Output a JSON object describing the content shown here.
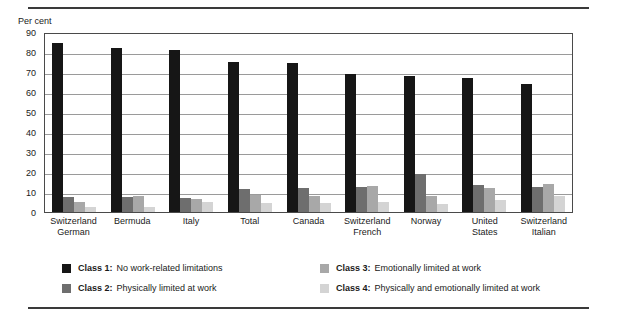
{
  "axis": {
    "y_title": "Per cent",
    "y_ticks": [
      "90",
      "80",
      "70",
      "60",
      "50",
      "40",
      "30",
      "20",
      "10",
      "0"
    ]
  },
  "legend": {
    "items": [
      {
        "key": "Class 1:",
        "desc": "No work-related limitations",
        "color": "#161616",
        "swatch": "class-1-swatch"
      },
      {
        "key": "Class 3:",
        "desc": "Emotionally limited at work",
        "color": "#a8a8a8",
        "swatch": "class-3-swatch"
      },
      {
        "key": "Class 2:",
        "desc": "Physically limited at work",
        "color": "#6e6e6e",
        "swatch": "class-2-swatch"
      },
      {
        "key": "Class 4:",
        "desc": "Physically and emotionally limited at work",
        "color": "#d4d4d4",
        "swatch": "class-4-swatch"
      }
    ]
  },
  "xlabels": [
    {
      "line1": "Switzerland",
      "line2": "German"
    },
    {
      "line1": "Bermuda",
      "line2": ""
    },
    {
      "line1": "Italy",
      "line2": ""
    },
    {
      "line1": "Total",
      "line2": ""
    },
    {
      "line1": "Canada",
      "line2": ""
    },
    {
      "line1": "Switzerland",
      "line2": "French"
    },
    {
      "line1": "Norway",
      "line2": ""
    },
    {
      "line1": "United",
      "line2": "States"
    },
    {
      "line1": "Switzerland",
      "line2": "Italian"
    }
  ],
  "chart_data": {
    "type": "bar",
    "title": "",
    "xlabel": "",
    "ylabel": "Per cent",
    "ylim": [
      0,
      90
    ],
    "ytick_step": 10,
    "grid": true,
    "legend_position": "bottom",
    "categories": [
      "Switzerland German",
      "Bermuda",
      "Italy",
      "Total",
      "Canada",
      "Switzerland French",
      "Norway",
      "United States",
      "Switzerland Italian"
    ],
    "series": [
      {
        "name": "Class 1: No work-related limitations",
        "color": "#161616",
        "values": [
          84.5,
          82,
          81,
          75,
          74.5,
          69,
          68,
          67,
          64
        ]
      },
      {
        "name": "Class 2: Physically limited at work",
        "color": "#6e6e6e",
        "values": [
          7.5,
          7.5,
          7,
          11.5,
          12,
          12.5,
          19,
          13.5,
          12.5
        ]
      },
      {
        "name": "Class 3: Emotionally limited at work",
        "color": "#a8a8a8",
        "values": [
          5,
          8,
          6.5,
          8.5,
          8,
          13,
          8,
          12,
          14
        ]
      },
      {
        "name": "Class 4: Physically and emotionally limited at work",
        "color": "#d4d4d4",
        "values": [
          2.5,
          2.5,
          5,
          4.5,
          4.5,
          5,
          4,
          6,
          8
        ]
      }
    ]
  }
}
